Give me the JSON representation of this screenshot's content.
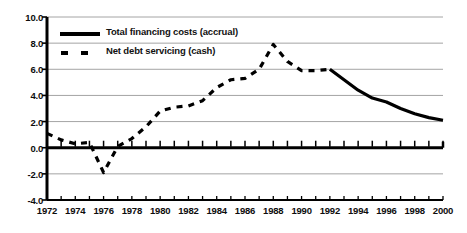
{
  "chart_data": {
    "type": "line",
    "title": "",
    "subtitle": "",
    "xlabel": "",
    "ylabel": "",
    "xlim": [
      1972,
      2000
    ],
    "ylim": [
      -4.0,
      10.0
    ],
    "grid": true,
    "legend_position": "upper-left-inside",
    "y_ticks": [
      "10.0",
      "8.0",
      "6.0",
      "4.0",
      "2.0",
      "0.0",
      "-2.0",
      "-4.0"
    ],
    "y_tick_values": [
      10.0,
      8.0,
      6.0,
      4.0,
      2.0,
      0.0,
      -2.0,
      -4.0
    ],
    "x_ticks": [
      "1972",
      "1974",
      "1976",
      "1978",
      "1980",
      "1982",
      "1984",
      "1986",
      "1988",
      "1990",
      "1992",
      "1994",
      "1996",
      "1998",
      "2000"
    ],
    "x_tick_values": [
      1972,
      1974,
      1976,
      1978,
      1980,
      1982,
      1984,
      1986,
      1988,
      1990,
      1992,
      1994,
      1996,
      1998,
      2000
    ],
    "x_minor_tick_interval": 1,
    "series": [
      {
        "name": "Total financing costs (accrual)",
        "style": "solid",
        "color": "#000000",
        "width": 3.2,
        "x": [
          1992,
          1993,
          1994,
          1995,
          1996,
          1997,
          1998,
          1999,
          2000
        ],
        "values": [
          6.0,
          5.2,
          4.4,
          3.8,
          3.5,
          3.0,
          2.6,
          2.3,
          2.1
        ]
      },
      {
        "name": "Net debt servicing (cash)",
        "style": "dashed",
        "color": "#000000",
        "width": 3.2,
        "x": [
          1972,
          1973,
          1974,
          1975,
          1976,
          1977,
          1978,
          1979,
          1980,
          1981,
          1982,
          1983,
          1984,
          1985,
          1986,
          1987,
          1988,
          1989,
          1990,
          1991,
          1992
        ],
        "values": [
          1.1,
          0.6,
          0.3,
          0.4,
          -1.9,
          0.1,
          0.7,
          1.6,
          2.8,
          3.1,
          3.2,
          3.6,
          4.6,
          5.2,
          5.3,
          6.0,
          7.9,
          6.6,
          5.9,
          5.9,
          6.0
        ]
      }
    ]
  },
  "legend": {
    "items": [
      {
        "label": "Total financing costs (accrual)",
        "style": "solid"
      },
      {
        "label": "Net debt servicing (cash)",
        "style": "dashed"
      }
    ]
  },
  "colors": {
    "axis": "#000000",
    "grid": "#9a9a9a",
    "zero_line": "#000000",
    "background": "#ffffff",
    "text": "#0d0d0d"
  }
}
